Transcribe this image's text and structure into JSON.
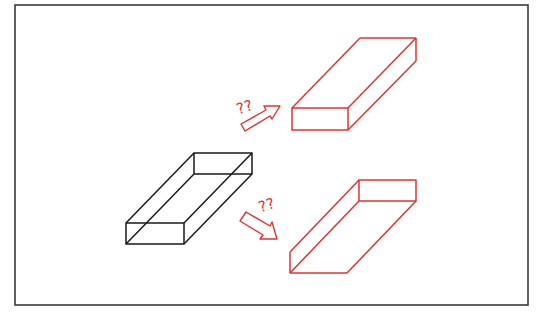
{
  "diagram": {
    "title": "",
    "colors": {
      "frame": "#3a3a3a",
      "original_box": "#1a1a1a",
      "candidate_box": "#e0332f",
      "arrow": "#e0332f",
      "question_marks": "#e0332f",
      "background": "#ffffff"
    },
    "frame": {
      "x": 15,
      "y": 5,
      "width": 513,
      "height": 300
    },
    "original_box": {
      "label": "wireframe-rectangular-box",
      "style": "transparent (all edges visible)"
    },
    "candidates": [
      {
        "label": "solid-box-interpretation",
        "style": "opaque box seen from above",
        "annotation": "??"
      },
      {
        "label": "open-tray-interpretation",
        "style": "box seen from below / open channel",
        "annotation": "??"
      }
    ],
    "annotations": {
      "upper_question": "??",
      "lower_question": "??"
    }
  }
}
